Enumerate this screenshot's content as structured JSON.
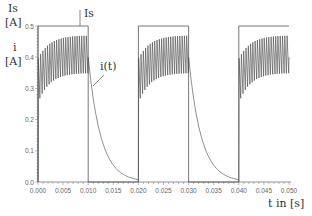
{
  "chart_data": {
    "type": "line",
    "title": "",
    "xlabel": "t in [s]",
    "ylabel_top": "Is [A]",
    "ylabel_bottom": "i [A]",
    "xlim": [
      0.0,
      0.05
    ],
    "ylim": [
      0.0,
      0.5
    ],
    "grid": false,
    "x_ticks": [
      "0.000",
      "0.005",
      "0.010",
      "0.015",
      "0.020",
      "0.025",
      "0.030",
      "0.035",
      "0.040",
      "0.045",
      "0.050"
    ],
    "y_ticks": [
      "0.0",
      "0.1",
      "0.2",
      "0.3",
      "0.4",
      "0.5"
    ],
    "series": [
      {
        "name": "Is",
        "description": "Rectangular source current pulses",
        "x": [
          0.0,
          0.0,
          0.01,
          0.01,
          0.02,
          0.02,
          0.03,
          0.03,
          0.04,
          0.04,
          0.05
        ],
        "values": [
          0.0,
          0.5,
          0.5,
          0.0,
          0.0,
          0.5,
          0.5,
          0.0,
          0.0,
          0.5,
          0.5
        ]
      },
      {
        "name": "i(t)",
        "description": "Load current: oscillates ~0.35–0.47 A during pulse, exponential decay to 0 after pulse ends",
        "pulse_on_intervals": [
          [
            0.0,
            0.01
          ],
          [
            0.02,
            0.03
          ],
          [
            0.04,
            0.05
          ]
        ],
        "oscillation_min": 0.35,
        "oscillation_max": 0.47,
        "initial_dip": 0.25,
        "decay_intervals": [
          [
            0.01,
            0.02
          ],
          [
            0.03,
            0.04
          ]
        ],
        "decay_start": 0.4,
        "decay_end": 0.0
      }
    ],
    "annotations": [
      {
        "text": "Is",
        "target": "Is pulse line",
        "x": 0.0095,
        "y": 0.52
      },
      {
        "text": "i(t)",
        "target": "decay curve",
        "x": 0.013,
        "y": 0.32
      }
    ]
  },
  "labels": {
    "y_top_1": "Is",
    "y_top_2": "[A]",
    "y_bot_1": "i",
    "y_bot_2": "[A]",
    "x_axis": "t in [s]",
    "is_annotation": "Is",
    "it_annotation": "i(t)"
  }
}
